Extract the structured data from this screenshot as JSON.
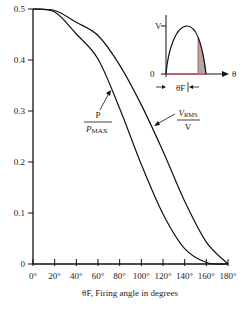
{
  "chart_data": {
    "type": "line",
    "title": "",
    "xlabel": "θF, Firing angle in degrees",
    "ylabel": "",
    "xlim": [
      0,
      180
    ],
    "ylim": [
      0,
      0.5
    ],
    "grid": false,
    "x_ticks": [
      "0°",
      "20°",
      "40°",
      "60°",
      "80°",
      "100°",
      "120°",
      "140°",
      "160°",
      "180°"
    ],
    "y_ticks": [
      "0",
      "0.1",
      "0.2",
      "0.3",
      "0.4",
      "0.5"
    ],
    "x": [
      0,
      20,
      40,
      60,
      80,
      100,
      120,
      140,
      160,
      180
    ],
    "series": [
      {
        "name": "P / P_MAX",
        "label_num": "P",
        "label_den": "PMAX",
        "values": [
          0.5,
          0.494,
          0.451,
          0.402,
          0.305,
          0.195,
          0.098,
          0.03,
          0.003,
          0.0
        ]
      },
      {
        "name": "V_RMS / V",
        "label_num": "VRMS",
        "label_den": "V",
        "values": [
          0.5,
          0.497,
          0.474,
          0.448,
          0.39,
          0.312,
          0.221,
          0.123,
          0.043,
          0.0
        ]
      }
    ],
    "inset": {
      "description": "Half sine wave with firing angle θF; conducting portion shaded after θF",
      "y_labels": [
        "V",
        "0"
      ],
      "x_label": "θ",
      "angle_label": "θF"
    },
    "legend": "inline labels with arrows"
  }
}
